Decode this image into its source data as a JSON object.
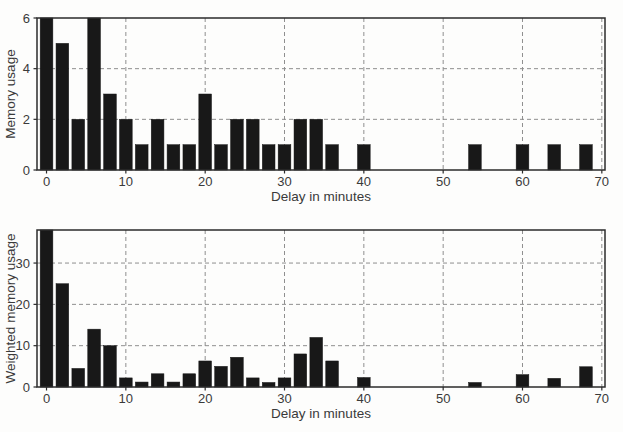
{
  "figure": {
    "background": "#fdfdfc",
    "panels": 2
  },
  "chart_data": [
    {
      "type": "bar",
      "title": "",
      "xlabel": "Delay in minutes",
      "ylabel": "Memory usage",
      "x": [
        0,
        2,
        4,
        6,
        8,
        10,
        12,
        14,
        16,
        18,
        20,
        22,
        24,
        26,
        28,
        30,
        32,
        34,
        36,
        38,
        40,
        42,
        44,
        46,
        48,
        50,
        52,
        54,
        56,
        58,
        60,
        62,
        64,
        66,
        68
      ],
      "values": [
        6,
        5,
        2,
        6,
        3,
        2,
        1,
        2,
        1,
        1,
        3,
        1,
        2,
        2,
        1,
        1,
        2,
        2,
        1,
        0,
        1,
        0,
        0,
        0,
        0,
        0,
        0,
        1,
        0,
        0,
        1,
        0,
        1,
        0,
        1
      ],
      "bar_width": 1.6,
      "xlim": [
        -1.2,
        70.4
      ],
      "ylim": [
        0,
        6
      ],
      "xticks": [
        0,
        10,
        20,
        30,
        40,
        50,
        60,
        70
      ],
      "yticks": [
        0,
        2,
        4,
        6
      ],
      "grid": "dashed",
      "colors": {
        "bar": "#181818",
        "axis": "#2b2b2b",
        "grid": "#8f8f8f",
        "text": "#3a3a3a"
      }
    },
    {
      "type": "bar",
      "title": "",
      "xlabel": "Delay in minutes",
      "ylabel": "Weighted memory usage",
      "x": [
        0,
        2,
        4,
        6,
        8,
        10,
        12,
        14,
        16,
        18,
        20,
        22,
        24,
        26,
        28,
        30,
        32,
        34,
        36,
        38,
        40,
        42,
        44,
        46,
        48,
        50,
        52,
        54,
        56,
        58,
        60,
        62,
        64,
        66,
        68
      ],
      "values": [
        38,
        25,
        4.5,
        14,
        10,
        2.2,
        1.2,
        3.2,
        1.2,
        3.2,
        6.3,
        5,
        7.2,
        2.2,
        1.1,
        2.2,
        8,
        12,
        6.3,
        0,
        2.3,
        0,
        0,
        0,
        0,
        0,
        0,
        1.1,
        0,
        0,
        3,
        0,
        2.1,
        0,
        4.9
      ],
      "bar_width": 1.6,
      "xlim": [
        -1.2,
        70.4
      ],
      "ylim": [
        0,
        38
      ],
      "xticks": [
        0,
        10,
        20,
        30,
        40,
        50,
        60,
        70
      ],
      "yticks": [
        0,
        10,
        20,
        30
      ],
      "grid": "dashed",
      "colors": {
        "bar": "#181818",
        "axis": "#2b2b2b",
        "grid": "#8f8f8f",
        "text": "#3a3a3a"
      }
    }
  ]
}
